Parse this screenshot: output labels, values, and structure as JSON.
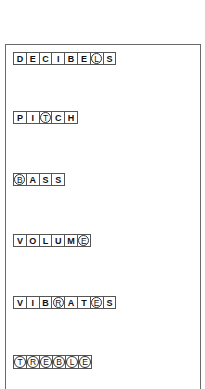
{
  "words": [
    {
      "word": "DECIBELS",
      "letters": [
        "D",
        "E",
        "C",
        "I",
        "B",
        "E",
        "L",
        "S"
      ],
      "circled": [
        6
      ]
    },
    {
      "word": "PITCH",
      "letters": [
        "P",
        "I",
        "T",
        "C",
        "H"
      ],
      "circled": [
        2
      ]
    },
    {
      "word": "BASS",
      "letters": [
        "B",
        "A",
        "S",
        "S"
      ],
      "circled": [
        0
      ]
    },
    {
      "word": "VOLUME",
      "letters": [
        "V",
        "O",
        "L",
        "U",
        "M",
        "E"
      ],
      "circled": [
        5
      ]
    },
    {
      "word": "VIBRATES",
      "letters": [
        "V",
        "I",
        "B",
        "R",
        "A",
        "T",
        "E",
        "S"
      ],
      "circled": [
        3,
        6
      ]
    },
    {
      "word": "TREBLE",
      "letters": [
        "T",
        "R",
        "E",
        "B",
        "L",
        "E"
      ],
      "circled": [
        0,
        1,
        2,
        3,
        4,
        5
      ]
    }
  ]
}
